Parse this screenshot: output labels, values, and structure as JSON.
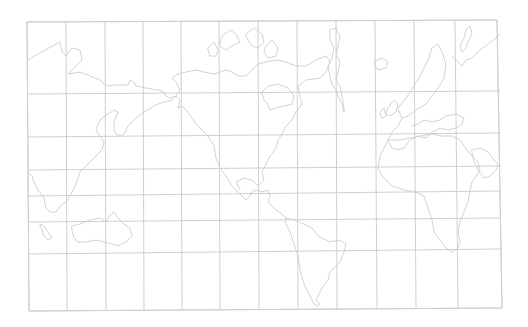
{
  "map": {
    "title": "",
    "projection": "world outline sketch, Pacific-centered",
    "colors": {
      "background": "#ffffff",
      "grid": "#c9c9c9",
      "coastline": "#cdcdcd"
    },
    "frame": {
      "corners": [
        [
          27,
          22
        ],
        [
          497,
          20
        ],
        [
          502,
          308
        ],
        [
          29,
          311
        ]
      ]
    },
    "graticule": {
      "vertical_lines": [
        {
          "top": [
            27,
            22
          ],
          "bottom": [
            29,
            311
          ]
        },
        {
          "top": [
            66,
            22
          ],
          "bottom": [
            67,
            311
          ]
        },
        {
          "top": [
            105,
            22
          ],
          "bottom": [
            106,
            310
          ]
        },
        {
          "top": [
            143,
            22
          ],
          "bottom": [
            144,
            310
          ]
        },
        {
          "top": [
            181,
            22
          ],
          "bottom": [
            182,
            310
          ]
        },
        {
          "top": [
            219,
            21
          ],
          "bottom": [
            220,
            310
          ]
        },
        {
          "top": [
            258,
            21
          ],
          "bottom": [
            259,
            309
          ]
        },
        {
          "top": [
            297,
            21
          ],
          "bottom": [
            298,
            309
          ]
        },
        {
          "top": [
            336,
            21
          ],
          "bottom": [
            337,
            309
          ]
        },
        {
          "top": [
            375,
            21
          ],
          "bottom": [
            377,
            309
          ]
        },
        {
          "top": [
            414,
            20
          ],
          "bottom": [
            416,
            308
          ]
        },
        {
          "top": [
            455,
            20
          ],
          "bottom": [
            458,
            308
          ]
        },
        {
          "top": [
            497,
            20
          ],
          "bottom": [
            502,
            308
          ]
        }
      ],
      "horizontal_lines": [
        {
          "left": [
            27,
            22
          ],
          "right": [
            497,
            20
          ]
        },
        {
          "left": [
            27,
            94
          ],
          "right": [
            500,
            91
          ]
        },
        {
          "left": [
            28,
            137
          ],
          "right": [
            501,
            133
          ]
        },
        {
          "left": [
            28,
            170
          ],
          "right": [
            501,
            166
          ]
        },
        {
          "left": [
            28,
            196
          ],
          "right": [
            501,
            191
          ]
        },
        {
          "left": [
            28,
            222
          ],
          "right": [
            501,
            218
          ]
        },
        {
          "left": [
            29,
            254
          ],
          "right": [
            502,
            249
          ]
        },
        {
          "left": [
            29,
            311
          ],
          "right": [
            502,
            308
          ]
        }
      ]
    },
    "coastlines": [
      {
        "name": "siberia-east-coast",
        "d": "M28 60 L45 50 L60 42 L62 52 L66 56 L72 48 L80 50 L82 60 L76 66 L70 72 L68 74 L80 72 L90 76 L100 80 L106 86 L116 85 L128 85 L130 80 L134 82 L136 86 L146 88 L158 90 L164 92 L166 96 L170 98 L176 96"
      },
      {
        "name": "kamchatka-and-east-asia",
        "d": "M176 96 L172 100 L158 104 L144 112 L136 118 L128 126 L124 134 L120 136 L116 134 L114 130 L114 122 L118 112 L114 110 L108 114 L100 120 L96 130 L100 136 L104 142 L102 150 L96 156 L92 160 L86 166 L80 172"
      },
      {
        "name": "southeast-asia",
        "d": "M80 172 L76 184 L70 196 L66 202 L60 206 L56 212 L50 212 L46 208 L44 198 L38 190 L34 182 L32 176 L28 172"
      },
      {
        "name": "sumatra-java",
        "d": "M40 224 L44 226 L48 232 L52 238 L48 240 L44 236 L42 230 Z"
      },
      {
        "name": "australia",
        "d": "M72 226 L80 224 L90 220 L100 218 L106 222 L110 215 L114 212 L118 218 L124 224 L130 228 L132 236 L126 242 L118 246 L112 244 L104 242 L96 240 L86 242 L78 242 L74 238 L72 230 Z"
      },
      {
        "name": "alaska-and-north-america-west",
        "d": "M176 96 L180 90 L176 82 L172 78 L178 74 L186 72 L196 70 L204 72 L214 74 L220 72 L226 70 L232 72 L238 76 L246 76 L252 70 L258 64 L266 62 L276 60 L286 62 L296 66 L306 66 L316 60 L326 56"
      },
      {
        "name": "north-america-pacific-coast",
        "d": "M176 96 L180 100 L178 108 L182 106 L188 112 L196 124 L208 136 L214 146 L216 158 L220 168 L226 176 L232 186 L240 194 L246 200 L250 196 L252 192 L256 190 L262 192 L268 190 L270 196 L268 202 L276 210 L282 214 L286 218"
      },
      {
        "name": "hudson-bay",
        "d": "M262 92 L268 86 L278 84 L288 88 L294 96 L292 104 L284 106 L276 108 L270 110 L268 104 L264 100 Z"
      },
      {
        "name": "canada-east-and-us-east",
        "d": "M326 56 L330 62 L326 72 L320 78 L306 80 L298 86 L300 96 L302 104 L296 112 L292 120 L286 126 L282 134 L278 140 L276 148 L270 156 L266 164 L262 172 L264 180 L258 186"
      },
      {
        "name": "gulf-of-mexico",
        "d": "M258 186 L252 180 L244 178 L236 182 L240 190"
      },
      {
        "name": "arctic-islands",
        "d": "M222 36 L230 30 L236 34 L240 42 L232 46 L226 50 L220 46 Z M246 34 L254 28 L262 34 L264 42 L258 48 L252 46 L248 40 Z M266 46 L272 40 L278 48 L276 56 L268 58 L264 52 Z M208 48 L214 42 L218 50 L216 56 L210 56 Z"
      },
      {
        "name": "greenland",
        "d": "M330 30 L336 28 L340 36 L338 46 L336 54 L340 62 L338 72 L336 80 L340 86 L342 96 L344 108 L344 112 L342 104 L338 96 L336 90 L332 84 L330 76 L328 66 L332 58 L334 48 L330 40 Z"
      },
      {
        "name": "south-america",
        "d": "M286 218 L294 220 L304 224 L312 228 L318 236 L330 242 L340 240 L346 244 L344 252 L340 262 L334 268 L330 272 L328 280 L322 288 L318 296 L316 300 L320 304 L318 306 L314 304 L310 296 L304 284 L300 270 L298 256 L294 244 L290 232 L286 224 Z"
      },
      {
        "name": "iceland",
        "d": "M374 62 L382 58 L388 62 L386 68 L378 70 Z"
      },
      {
        "name": "scandinavia",
        "d": "M398 108 L406 98 L414 86 L420 76 L428 60 L432 48 L438 44 L442 52 L446 64 L444 78 L438 88 L432 96 L426 104 L416 110 L408 116 L402 118 Z"
      },
      {
        "name": "british-isles",
        "d": "M388 108 L394 100 L398 104 L396 112 L390 116 L386 114 Z M380 112 L384 108 L386 116 L382 118 Z"
      },
      {
        "name": "europe-coast",
        "d": "M402 118 L398 126 L392 132 L388 140 L392 148 L398 150 L404 148 L410 140 L418 136 L426 138 L432 132 L440 128 L448 130 L456 128 L462 124 L464 118 L456 114 L446 116 L440 120 L432 122 L424 120 L418 124 L412 126"
      },
      {
        "name": "russia-arctic-coast",
        "d": "M452 56 L458 62 L462 66 L466 60 L472 58 L480 50 L488 44 L496 38 L500 34"
      },
      {
        "name": "novaya-zemlya",
        "d": "M466 30 L470 26 L472 34 L468 42 L466 48 L462 52 L460 46 L464 38 Z"
      },
      {
        "name": "africa",
        "d": "M388 140 L384 148 L380 156 L378 168 L382 176 L392 186 L404 190 L416 192 L424 196 L428 208 L432 220 L434 232 L440 240 L446 248 L452 252 L458 248 L460 240 L458 232 L460 222 L464 212 L468 202 L470 190 L472 182 L476 176 L480 170 L478 162 L470 154 L464 146 L460 140 L452 136 L442 136 L432 134 L420 136 L410 138 L400 140 L392 140 Z"
      },
      {
        "name": "arabia",
        "d": "M472 150 L480 148 L488 152 L494 160 L498 164 L496 170 L490 176 L484 178 L478 170 L474 162 Z"
      }
    ]
  }
}
